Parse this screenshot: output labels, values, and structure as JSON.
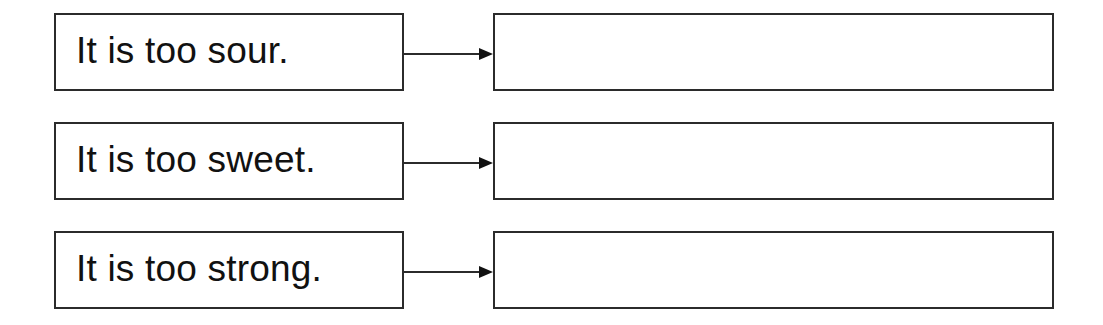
{
  "diagram": {
    "rows": [
      {
        "prompt": "It is too sour.",
        "answer": ""
      },
      {
        "prompt": "It is too sweet.",
        "answer": ""
      },
      {
        "prompt": "It is too strong.",
        "answer": ""
      }
    ],
    "colors": {
      "border": "#2b2b2b",
      "text": "#111111",
      "background": "#ffffff"
    },
    "connector_icon": "arrow-right-icon"
  }
}
